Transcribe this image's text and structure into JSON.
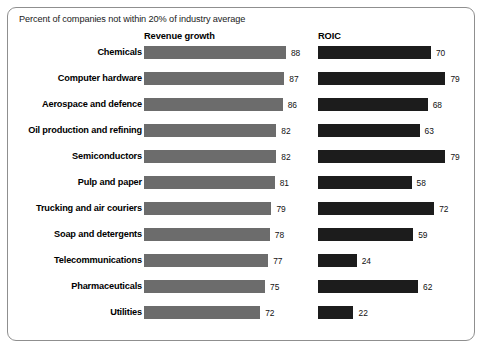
{
  "chart_data": {
    "type": "bar",
    "title": "Percent of companies not within 20% of industry average",
    "xlabel": "",
    "ylabel": "",
    "xlim": [
      0,
      100
    ],
    "grid": false,
    "orientation": "horizontal",
    "legend_position": "top-as-column-headers",
    "categories": [
      "Chemicals",
      "Computer hardware",
      "Aerospace and defence",
      "Oil production and refining",
      "Semiconductors",
      "Pulp and paper",
      "Trucking and air couriers",
      "Soap and detergents",
      "Telecommunications",
      "Pharmaceuticals",
      "Utilities"
    ],
    "series": [
      {
        "name": "Revenue growth",
        "color": "#6c6c6c",
        "values": [
          88,
          87,
          86,
          82,
          82,
          81,
          79,
          78,
          77,
          75,
          72
        ]
      },
      {
        "name": "ROIC",
        "color": "#1c1c1c",
        "values": [
          70,
          79,
          68,
          63,
          79,
          58,
          72,
          59,
          24,
          62,
          22
        ]
      }
    ]
  },
  "caption": "Percent of companies not within 20% of industry average",
  "headers": {
    "revenue": "Revenue growth",
    "roic": "ROIC"
  },
  "rows": [
    {
      "label": "Chemicals",
      "revenue": 88,
      "roic": 70
    },
    {
      "label": "Computer hardware",
      "revenue": 87,
      "roic": 79
    },
    {
      "label": "Aerospace and defence",
      "revenue": 86,
      "roic": 68
    },
    {
      "label": "Oil production and refining",
      "revenue": 82,
      "roic": 63
    },
    {
      "label": "Semiconductors",
      "revenue": 82,
      "roic": 79
    },
    {
      "label": "Pulp and paper",
      "revenue": 81,
      "roic": 58
    },
    {
      "label": "Trucking and air couriers",
      "revenue": 79,
      "roic": 72
    },
    {
      "label": "Soap and detergents",
      "revenue": 78,
      "roic": 59
    },
    {
      "label": "Telecommunications",
      "revenue": 77,
      "roic": 24
    },
    {
      "label": "Pharmaceuticals",
      "revenue": 75,
      "roic": 62
    },
    {
      "label": "Utilities",
      "revenue": 72,
      "roic": 22
    }
  ],
  "scale": {
    "px_per_unit": 1.613
  },
  "colors": {
    "revenue_bar": "#6c6c6c",
    "roic_bar": "#1c1c1c",
    "frame_border": "#8f8f8f",
    "text": "#1a1a1a",
    "background": "#ffffff"
  }
}
